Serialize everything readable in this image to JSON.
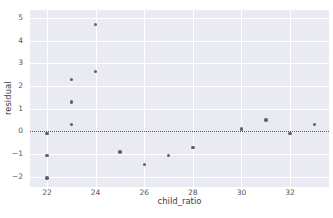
{
  "chart_data": {
    "type": "scatter",
    "title": "",
    "xlabel": "child_ratio",
    "ylabel": "residual",
    "xlim": [
      21.3,
      33.6
    ],
    "ylim": [
      -2.45,
      5.35
    ],
    "xticks": [
      22,
      24,
      26,
      28,
      30,
      32
    ],
    "yticks": [
      -2,
      -1,
      0,
      1,
      2,
      3,
      4,
      5
    ],
    "grid": true,
    "legend": null,
    "reference_line": {
      "orientation": "horizontal",
      "y": 0,
      "style": "dotted",
      "color": "#4a4a4a"
    },
    "marker_color": "#5f5f6e",
    "panel_color": "#eaeaf2",
    "grid_color": "#ffffff",
    "points": [
      {
        "x": 22,
        "y": -0.1
      },
      {
        "x": 22,
        "y": -1.05
      },
      {
        "x": 22,
        "y": -2.05
      },
      {
        "x": 23,
        "y": 2.3
      },
      {
        "x": 23,
        "y": 1.3
      },
      {
        "x": 23,
        "y": 0.3
      },
      {
        "x": 24,
        "y": 4.7
      },
      {
        "x": 24,
        "y": 2.65
      },
      {
        "x": 25,
        "y": -0.9
      },
      {
        "x": 26,
        "y": -1.45
      },
      {
        "x": 27,
        "y": -1.05
      },
      {
        "x": 28,
        "y": -0.7
      },
      {
        "x": 30,
        "y": 0.1
      },
      {
        "x": 31,
        "y": 0.5
      },
      {
        "x": 32,
        "y": -0.1
      },
      {
        "x": 33,
        "y": 0.3
      }
    ]
  }
}
